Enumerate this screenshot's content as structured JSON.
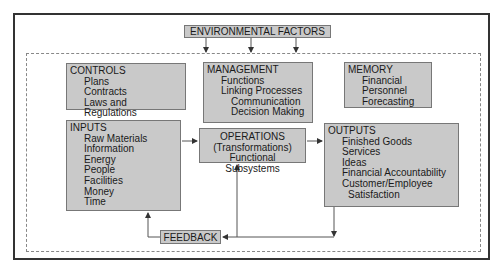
{
  "environment": {
    "label": "ENVIRONMENTAL FACTORS"
  },
  "controls": {
    "title": "CONTROLS",
    "items": [
      "Plans",
      "Contracts",
      "Laws and Regulations"
    ]
  },
  "management": {
    "title": "MANAGEMENT",
    "items": [
      "Functions",
      "Linking Processes"
    ],
    "subitems": [
      "Communication",
      "Decision Making"
    ]
  },
  "memory": {
    "title": "MEMORY",
    "items": [
      "Financial",
      "Personnel",
      "Forecasting"
    ]
  },
  "inputs": {
    "title": "INPUTS",
    "items": [
      "Raw Materials",
      "Information",
      "Energy",
      "People",
      "Facilities",
      "Money",
      "Time"
    ]
  },
  "operations": {
    "lines": [
      "OPERATIONS",
      "(Transformations)",
      "Functional Subsystems"
    ]
  },
  "outputs": {
    "title": "OUTPUTS",
    "items": [
      "Finished Goods",
      "Services",
      "Ideas",
      "Financial Accountability",
      "Customer/Employee"
    ],
    "continuation": "Satisfaction"
  },
  "feedback": {
    "label": "FEEDBACK"
  },
  "colors": {
    "box_fill": "#c9c9c9",
    "box_border": "#777777",
    "line": "#444444"
  }
}
